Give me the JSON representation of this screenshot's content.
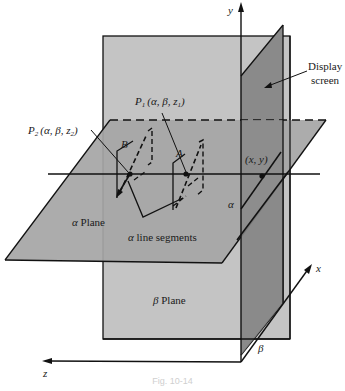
{
  "figure": {
    "labels": {
      "y_axis": "y",
      "x_axis": "x",
      "z_axis": "z",
      "display_screen_line1": "Display",
      "display_screen_line2": "screen",
      "p1": "P",
      "p1_sub": "1",
      "p1_coords": "(α, β, z",
      "p1_coords_sub": "1",
      "p1_close": ")",
      "p2": "P",
      "p2_sub": "2",
      "p2_coords": "(α, β, z",
      "p2_coords_sub": "2",
      "p2_close": ")",
      "point_b": "B",
      "point_a": "A",
      "screen_point": "(x, y)",
      "alpha_marker": "α",
      "beta_marker": "β",
      "alpha_plane_symbol": "α",
      "alpha_plane_word": " Plane",
      "alpha_segments_symbol": "α",
      "alpha_segments_word": " line segments",
      "beta_plane_symbol": "β",
      "beta_plane_word": " Plane"
    },
    "colors": {
      "background": "#ffffff",
      "beta_plane_fill": "#c4c4c4",
      "alpha_plane_fill": "#a6a6a6",
      "display_screen_fill": "#8a8a8a",
      "line": "#111111"
    },
    "caption": "Fig. 10-14"
  }
}
